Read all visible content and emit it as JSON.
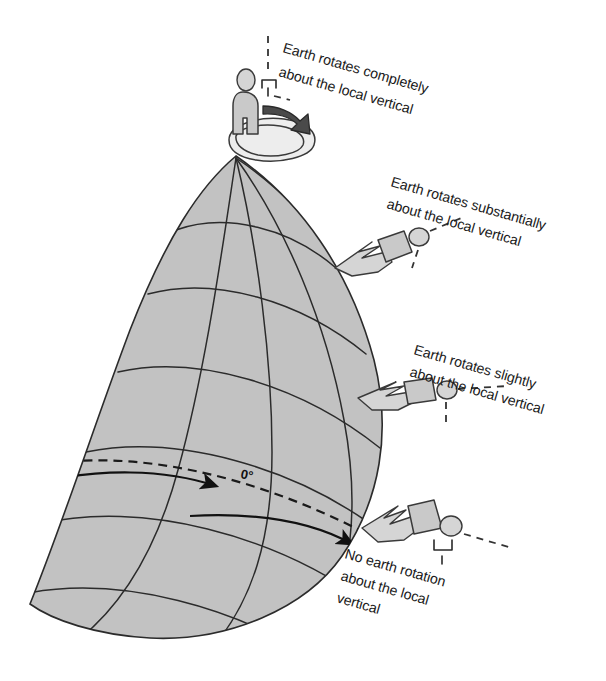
{
  "figure": {
    "background_color": "#ffffff",
    "globe_fill_color": "#c2c2c2",
    "line_color": "#2b2b2b"
  },
  "equator": {
    "label": "0°",
    "style": "dashed with direction arrows"
  },
  "annotations": [
    {
      "id": "pole",
      "line1": "Earth rotates completely",
      "line2": "about the local vertical",
      "latitude_position": "north pole",
      "figure_pose": "standing"
    },
    {
      "id": "high-latitude",
      "line1": "Earth rotates substantially",
      "line2": "about the local vertical",
      "latitude_position": "high latitude",
      "figure_pose": "reclining"
    },
    {
      "id": "mid-latitude",
      "line1": "Earth rotates slightly",
      "line2": "about the local vertical",
      "latitude_position": "mid latitude",
      "figure_pose": "reclining"
    },
    {
      "id": "equator",
      "line1": "No earth rotation",
      "line2": "about  the local",
      "line3": "vertical",
      "latitude_position": "equator",
      "figure_pose": "lying"
    }
  ]
}
